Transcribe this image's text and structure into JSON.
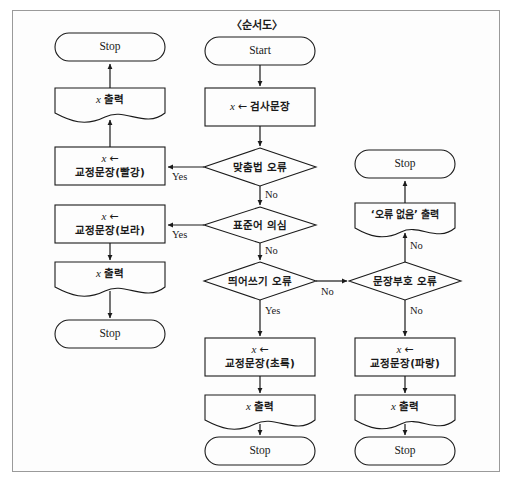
{
  "figure": {
    "title": "〈순서도〉",
    "type": "flowchart",
    "language": "ko"
  },
  "labels": {
    "start": "Start",
    "stop": "Stop",
    "yes": "Yes",
    "no": "No",
    "assign_arrow": "←",
    "var_x": "x"
  },
  "nodes": {
    "start": {
      "shape": "terminal",
      "text": "Start"
    },
    "read_input": {
      "shape": "process",
      "var": "x",
      "arrow": "←",
      "text": "검사문장"
    },
    "d_spelling": {
      "shape": "decision",
      "text": "맞춤법 오류"
    },
    "d_standard": {
      "shape": "decision",
      "text": "표준어 의심"
    },
    "d_spacing": {
      "shape": "decision",
      "text": "띄어쓰기 오류"
    },
    "d_punct": {
      "shape": "decision",
      "text": "문장부호 오류"
    },
    "fix_red": {
      "shape": "process",
      "var": "x",
      "arrow": "←",
      "text": "교정문장(빨강)"
    },
    "fix_purple": {
      "shape": "process",
      "var": "x",
      "arrow": "←",
      "text": "교정문장(보라)"
    },
    "fix_green": {
      "shape": "process",
      "var": "x",
      "arrow": "←",
      "text": "교정문장(초록)"
    },
    "fix_blue": {
      "shape": "process",
      "var": "x",
      "arrow": "←",
      "text": "교정문장(파랑)"
    },
    "print_red": {
      "shape": "document",
      "var": "x",
      "text": "출력"
    },
    "print_purple": {
      "shape": "document",
      "var": "x",
      "text": "출력"
    },
    "print_green": {
      "shape": "document",
      "var": "x",
      "text": "출력"
    },
    "print_blue": {
      "shape": "document",
      "var": "x",
      "text": "출력"
    },
    "print_noerror": {
      "shape": "document",
      "text": "‘오류 없음’ 출력"
    },
    "stop_red": {
      "shape": "terminal",
      "text": "Stop"
    },
    "stop_purple": {
      "shape": "terminal",
      "text": "Stop"
    },
    "stop_green": {
      "shape": "terminal",
      "text": "Stop"
    },
    "stop_blue": {
      "shape": "terminal",
      "text": "Stop"
    },
    "stop_noerror": {
      "shape": "terminal",
      "text": "Stop"
    }
  },
  "edges": [
    {
      "from": "start",
      "to": "read_input",
      "label": ""
    },
    {
      "from": "read_input",
      "to": "d_spelling",
      "label": ""
    },
    {
      "from": "d_spelling",
      "to": "fix_red",
      "label": "Yes"
    },
    {
      "from": "d_spelling",
      "to": "d_standard",
      "label": "No"
    },
    {
      "from": "fix_red",
      "to": "print_red",
      "label": ""
    },
    {
      "from": "print_red",
      "to": "stop_red",
      "label": ""
    },
    {
      "from": "d_standard",
      "to": "fix_purple",
      "label": "Yes"
    },
    {
      "from": "d_standard",
      "to": "d_spacing",
      "label": "No"
    },
    {
      "from": "fix_purple",
      "to": "print_purple",
      "label": ""
    },
    {
      "from": "print_purple",
      "to": "stop_purple",
      "label": ""
    },
    {
      "from": "d_spacing",
      "to": "fix_green",
      "label": "Yes"
    },
    {
      "from": "d_spacing",
      "to": "d_punct",
      "label": "No"
    },
    {
      "from": "fix_green",
      "to": "print_green",
      "label": ""
    },
    {
      "from": "print_green",
      "to": "stop_green",
      "label": ""
    },
    {
      "from": "d_punct",
      "to": "print_noerror",
      "label": "No"
    },
    {
      "from": "d_punct",
      "to": "fix_blue",
      "label": "No"
    },
    {
      "from": "print_noerror",
      "to": "stop_noerror",
      "label": ""
    },
    {
      "from": "fix_blue",
      "to": "print_blue",
      "label": ""
    },
    {
      "from": "print_blue",
      "to": "stop_blue",
      "label": ""
    }
  ],
  "edge_labels": {
    "spelling_yes": "Yes",
    "spelling_no": "No",
    "standard_yes": "Yes",
    "standard_no": "No",
    "spacing_yes": "Yes",
    "spacing_no": "No",
    "punct_up_no": "No",
    "punct_down_no": "No"
  },
  "colors": {
    "stroke": "#1a1a1a",
    "frame": "#9a9a9a",
    "background": "#fdfdfd",
    "text": "#1a1a1a"
  }
}
